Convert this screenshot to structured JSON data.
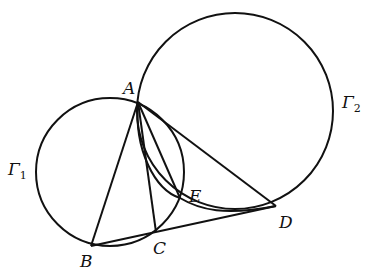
{
  "diagram": {
    "circles": [
      {
        "name": "Γ1",
        "label": "Γ",
        "subscript": "1",
        "cx": 110,
        "cy": 172,
        "r": 74
      },
      {
        "name": "Γ2",
        "label": "Γ",
        "subscript": "2",
        "cx": 235,
        "cy": 111,
        "r": 98
      }
    ],
    "points": {
      "A": {
        "label": "A",
        "x": 138,
        "y": 102
      },
      "B": {
        "label": "B",
        "x": 91,
        "y": 246
      },
      "C": {
        "label": "C",
        "x": 156,
        "y": 232
      },
      "D": {
        "label": "D",
        "x": 276,
        "y": 206
      },
      "E": {
        "label": "E",
        "x": 180,
        "y": 198
      }
    },
    "segments": [
      "AB",
      "AC",
      "AE",
      "AD",
      "BD"
    ],
    "arc": "A-E-D inner arc"
  }
}
